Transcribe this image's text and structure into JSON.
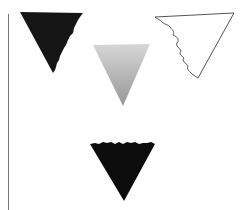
{
  "figure": {
    "shapes": [
      {
        "id": "triangle-top-left",
        "fill": "#151515",
        "style": "solid dark, jagged right edge"
      },
      {
        "id": "triangle-center",
        "fill_top": "#d4d4d4",
        "fill_bottom": "#9a9a9a",
        "style": "gray gradient"
      },
      {
        "id": "triangle-top-right",
        "fill": "#ffffff",
        "stroke": "#555555",
        "style": "outline, wavy left edge"
      },
      {
        "id": "triangle-bottom",
        "fill": "#0c0c0c",
        "style": "solid black, jagged top edge"
      }
    ],
    "divider_color": "#777777"
  }
}
